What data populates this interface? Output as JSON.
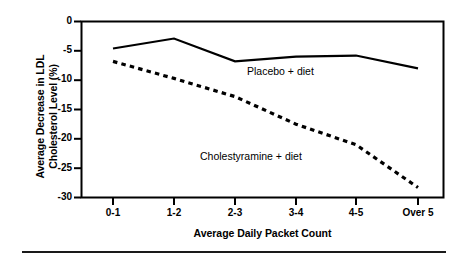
{
  "chart_data": {
    "type": "line",
    "title": "",
    "xlabel": "Average Daily Packet Count",
    "ylabel": "Average Decrease in LDL Cholesterol Level (%)",
    "ylabel_line1": "Average Decrease in LDL",
    "ylabel_line2": "Cholesterol Level (%)",
    "categories": [
      "0-1",
      "1-2",
      "2-3",
      "3-4",
      "4-5",
      "Over 5"
    ],
    "ylim": [
      -30,
      0
    ],
    "yticks": [
      "0",
      "-5",
      "-10",
      "-15",
      "-20",
      "-25",
      "-30"
    ],
    "ytick_values": [
      0,
      -5,
      -10,
      -15,
      -20,
      -25,
      -30
    ],
    "grid": false,
    "legend_position": "inline-annotations",
    "series": [
      {
        "name": "Placebo + diet",
        "style": "solid",
        "color": "#000000",
        "values": [
          -4.6,
          -2.9,
          -6.8,
          -6.0,
          -5.8,
          -8.0
        ]
      },
      {
        "name": "Cholestyramine + diet",
        "style": "dashed",
        "color": "#000000",
        "values": [
          -6.8,
          -9.7,
          -12.8,
          -17.5,
          -21.0,
          -28.3
        ]
      }
    ],
    "annotations": [
      {
        "text": "Placebo + diet",
        "series": "Placebo + diet"
      },
      {
        "text": "Cholestyramine + diet",
        "series": "Cholestyramine + diet"
      }
    ]
  },
  "figure": {
    "frame_color": "#000000",
    "background": "#ffffff",
    "bottom_rule": true
  }
}
